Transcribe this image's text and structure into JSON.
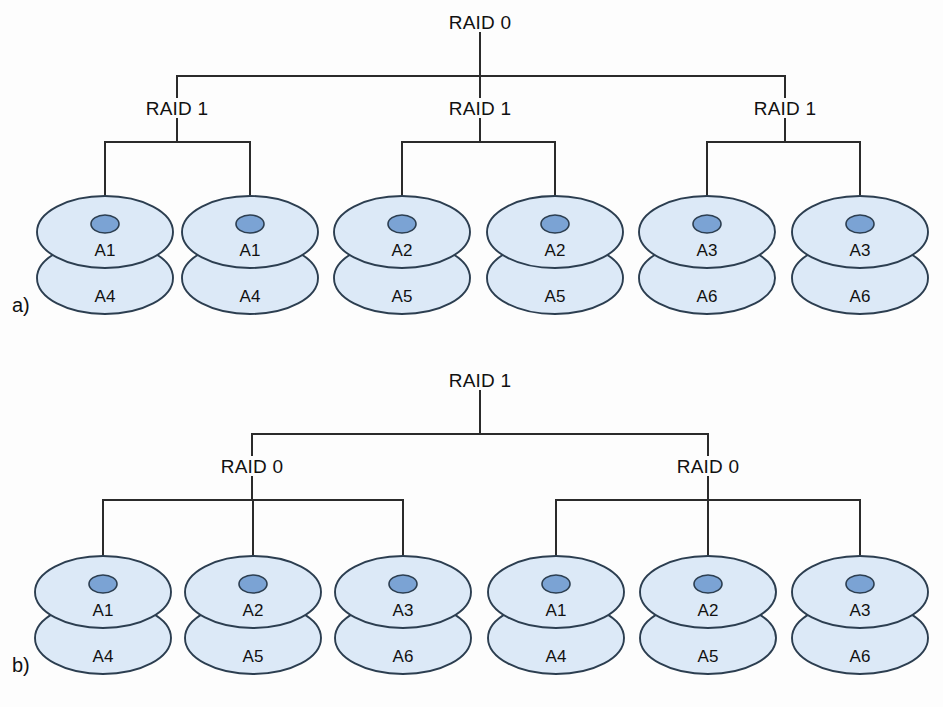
{
  "figure": {
    "background_color": "#fdfdfd",
    "line_color": "#2b2b2b",
    "disk_fill": "#dce9f7",
    "disk_stroke": "#2c3e50",
    "hub_fill": "#7ba3d4",
    "hub_stroke": "#2c3e50"
  },
  "panels": [
    {
      "id": "a",
      "label": "a)",
      "label_x": 12,
      "label_y": 295,
      "root": {
        "name": "raid0-root",
        "label": "RAID 0",
        "x": 480,
        "y": 22
      },
      "bus_y": 76,
      "group_label_y": 108,
      "branch_y": 142,
      "groups": [
        {
          "name": "raid1-group-left",
          "label": "RAID 1",
          "x": 177
        },
        {
          "name": "raid1-group-middle",
          "label": "RAID 1",
          "x": 480
        },
        {
          "name": "raid1-group-right",
          "label": "RAID 1",
          "x": 785
        }
      ],
      "disk_top_y": 232,
      "disks": [
        {
          "x": 105,
          "top": "A1",
          "bottom": "A4",
          "group": 0
        },
        {
          "x": 250,
          "top": "A1",
          "bottom": "A4",
          "group": 0
        },
        {
          "x": 402,
          "top": "A2",
          "bottom": "A5",
          "group": 1
        },
        {
          "x": 555,
          "top": "A2",
          "bottom": "A5",
          "group": 1
        },
        {
          "x": 707,
          "top": "A3",
          "bottom": "A6",
          "group": 2
        },
        {
          "x": 860,
          "top": "A3",
          "bottom": "A6",
          "group": 2
        }
      ]
    },
    {
      "id": "b",
      "label": "b)",
      "label_x": 12,
      "label_y": 655,
      "root": {
        "name": "raid1-root",
        "label": "RAID 1",
        "x": 480,
        "y": 380
      },
      "bus_y": 434,
      "group_label_y": 466,
      "branch_y": 500,
      "groups": [
        {
          "name": "raid0-group-left",
          "label": "RAID 0",
          "x": 252
        },
        {
          "name": "raid0-group-right",
          "label": "RAID 0",
          "x": 708
        }
      ],
      "disk_top_y": 592,
      "disks": [
        {
          "x": 103,
          "top": "A1",
          "bottom": "A4",
          "group": 0
        },
        {
          "x": 253,
          "top": "A2",
          "bottom": "A5",
          "group": 0
        },
        {
          "x": 403,
          "top": "A3",
          "bottom": "A6",
          "group": 0
        },
        {
          "x": 556,
          "top": "A1",
          "bottom": "A4",
          "group": 1
        },
        {
          "x": 708,
          "top": "A2",
          "bottom": "A5",
          "group": 1
        },
        {
          "x": 860,
          "top": "A3",
          "bottom": "A6",
          "group": 1
        }
      ]
    }
  ],
  "geometry": {
    "disk_rx": 68,
    "disk_ry": 36,
    "disk_stack_offset": 46,
    "hub_rx": 14,
    "hub_ry": 9,
    "hub_dy": -8,
    "top_text_dy": 18,
    "bottom_text_dy": 18,
    "leader_top_offset": -44
  }
}
